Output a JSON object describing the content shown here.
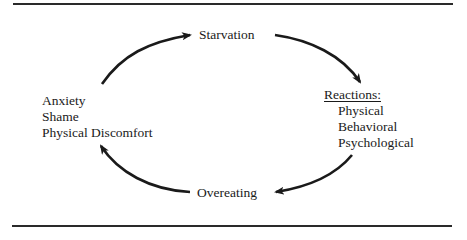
{
  "diagram": {
    "type": "cycle",
    "nodes": {
      "top": {
        "label": "Starvation"
      },
      "right": {
        "heading": "Reactions:",
        "items": [
          "Physical",
          "Behavioral",
          "Psychological"
        ]
      },
      "bottom": {
        "label": "Overeating"
      },
      "left": {
        "items": [
          "Anxiety",
          "Shame",
          "Physical Discomfort"
        ]
      }
    },
    "edges": [
      {
        "from": "left",
        "to": "top"
      },
      {
        "from": "top",
        "to": "right"
      },
      {
        "from": "right",
        "to": "bottom"
      },
      {
        "from": "bottom",
        "to": "left"
      }
    ],
    "colors": {
      "ink": "#1a1a1a",
      "background": "#ffffff"
    }
  }
}
